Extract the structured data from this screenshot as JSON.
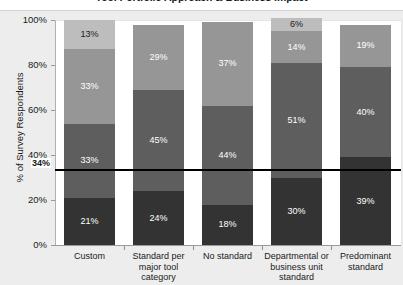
{
  "chart_data": {
    "type": "bar",
    "subtype": "stacked-column-100",
    "title": "Tool Portfolio Approach & Business Impact",
    "xlabel": "",
    "ylabel": "% of Survey Respondents",
    "ylim": [
      0,
      100
    ],
    "ytick_labels": [
      "0%",
      "20%",
      "40%",
      "60%",
      "80%",
      "100%"
    ],
    "ytick_values": [
      0,
      20,
      40,
      60,
      80,
      100
    ],
    "grid": false,
    "legend": "none",
    "categories": [
      "Custom",
      "Standard per major tool category",
      "No standard",
      "Departmental or business unit standard",
      "Predominant standard"
    ],
    "series": [
      {
        "name": "segment-1",
        "color": "#333333",
        "label_color": "#ffffff",
        "values": [
          21,
          24,
          18,
          30,
          39
        ],
        "labels": [
          "21%",
          "24%",
          "18%",
          "30%",
          "39%"
        ]
      },
      {
        "name": "segment-2",
        "color": "#5e5e5e",
        "label_color": "#ffffff",
        "values": [
          33,
          45,
          44,
          51,
          40
        ],
        "labels": [
          "33%",
          "45%",
          "44%",
          "51%",
          "40%"
        ]
      },
      {
        "name": "segment-3",
        "color": "#969696",
        "label_color": "#ffffff",
        "values": [
          33,
          29,
          37,
          14,
          19
        ],
        "labels": [
          "33%",
          "29%",
          "37%",
          "14%",
          "19%"
        ]
      },
      {
        "name": "segment-4",
        "color": "#bdbdbd",
        "label_color": "#1a1a1a",
        "values": [
          13,
          0,
          0,
          6,
          0
        ],
        "labels": [
          "13%",
          "",
          "",
          "6%",
          ""
        ]
      }
    ],
    "reference_line": {
      "value": 34,
      "label": "34%",
      "color": "#000000"
    }
  }
}
